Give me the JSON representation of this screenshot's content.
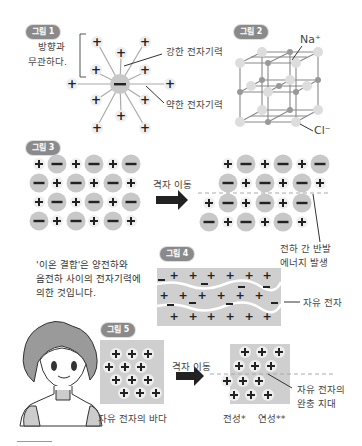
{
  "figures": {
    "fig1": {
      "badge": "그림 1",
      "bracket_label_line1": "방향과",
      "bracket_label_line2": "무관하다.",
      "strong_label": "강한 전자기력",
      "weak_label": "약한 전자기력",
      "center_ion": "−",
      "surrounding_ion": "+"
    },
    "fig2": {
      "badge": "그림 2",
      "na_label": "Na⁺",
      "cl_label": "Cl⁻"
    },
    "fig3": {
      "badge": "그림 3",
      "arrow_label": "격자 이동",
      "lattice_before": [
        [
          "+",
          "−",
          "+",
          "−",
          "+",
          "−"
        ],
        [
          "−",
          "+",
          "−",
          "+",
          "−",
          "+"
        ],
        [
          "+",
          "−",
          "+",
          "−",
          "+",
          "−"
        ],
        [
          "−",
          "+",
          "−",
          "+",
          "−",
          "+"
        ]
      ],
      "repulsion_label_line1": "전하 간 반발",
      "repulsion_label_line2": "에너지 발생"
    },
    "fig4": {
      "badge": "그림 4",
      "free_electron_label": "자유 전자"
    },
    "fig5": {
      "badge": "그림 5",
      "sea_label": "자유 전자의 바다",
      "arrow_label": "격자 이동",
      "buffer_label_line1": "자유 전자의",
      "buffer_label_line2": "완충 지대",
      "ductility_label": "전성*",
      "malleability_label": "연성**"
    },
    "note": {
      "line1": "'이온 결합'은 양전하와",
      "line2": "음전하 사이의 전자기력에",
      "line3": "의한 것입니다."
    }
  },
  "colors": {
    "badge_bg": "#8a8a8a",
    "negative_ion": "#c8c8c8",
    "positive_ion": "#eeeeee",
    "arrow": "#222222",
    "metal_bg": "#cfcfcf"
  }
}
